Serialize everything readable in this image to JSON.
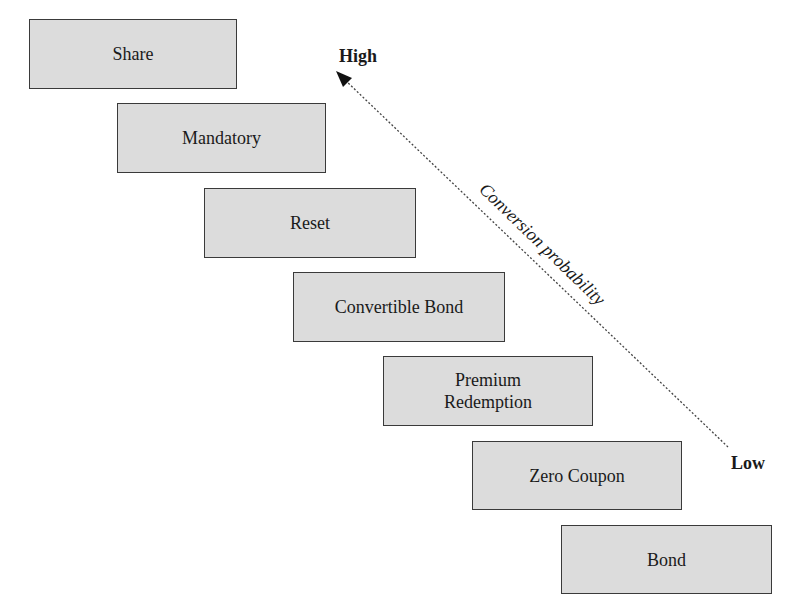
{
  "diagram": {
    "boxes": [
      {
        "label": "Share"
      },
      {
        "label": "Mandatory"
      },
      {
        "label": "Reset"
      },
      {
        "label": "Convertible Bond"
      },
      {
        "label": "Premium\nRedemption"
      },
      {
        "label": "Zero Coupon"
      },
      {
        "label": "Bond"
      }
    ],
    "axis": {
      "high_label": "High",
      "low_label": "Low",
      "title": "Conversion probability"
    }
  }
}
